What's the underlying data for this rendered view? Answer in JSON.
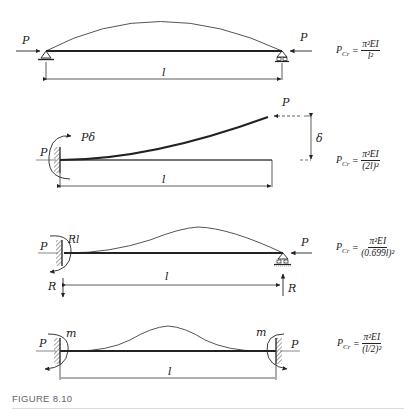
{
  "figure": {
    "caption": "FIGURE 8.10",
    "cases": [
      {
        "id": "pinned-pinned",
        "labels": {
          "load_left": "P",
          "load_right": "P",
          "length": "l"
        },
        "formula": {
          "lhs": "P",
          "lhs_sub": "Cr",
          "eq": "=",
          "numerator": "π²EI",
          "denominator": "l²"
        }
      },
      {
        "id": "fixed-free",
        "labels": {
          "load_left": "P",
          "moment": "Pδ",
          "load_tip": "P",
          "deflection": "δ",
          "length": "l"
        },
        "formula": {
          "lhs": "P",
          "lhs_sub": "Cr",
          "eq": "=",
          "numerator": "π²EI",
          "denominator": "(2l)²"
        }
      },
      {
        "id": "fixed-pinned",
        "labels": {
          "load_left": "P",
          "moment": "Rl",
          "reaction_left": "R",
          "load_right": "P",
          "reaction_right": "R",
          "length": "l"
        },
        "formula": {
          "lhs": "P",
          "lhs_sub": "Cr",
          "eq": "=",
          "numerator": "π²EI",
          "denominator": "(0.699l)²"
        }
      },
      {
        "id": "fixed-fixed",
        "labels": {
          "load_left": "P",
          "moment_left": "m",
          "moment_right": "m",
          "load_right": "P",
          "length": "l"
        },
        "formula": {
          "lhs": "P",
          "lhs_sub": "Cr",
          "eq": "=",
          "numerator": "π²EI",
          "denominator": "(l/2)²"
        }
      }
    ]
  }
}
